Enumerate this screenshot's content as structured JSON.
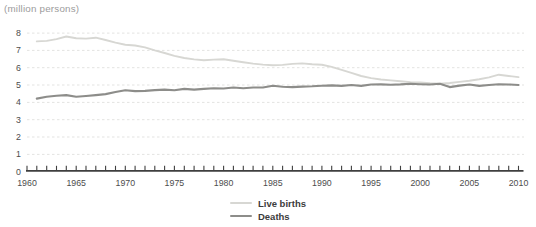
{
  "title": "(million persons)",
  "legend": [
    {
      "label": "Live births",
      "color": "#d7d7d3"
    },
    {
      "label": "Deaths",
      "color": "#8d8d8a"
    }
  ],
  "chart_data": {
    "type": "line",
    "unit_label": "(million persons)",
    "grid": "horizontal-dashed",
    "grid_color": "#e3e3e1",
    "axis_color": "#3f3f3f",
    "legend_position": "bottom-center",
    "x_axis_range": [
      1960,
      2010
    ],
    "xtick_labels": [
      1960,
      1965,
      1970,
      1975,
      1980,
      1985,
      1990,
      1995,
      2000,
      2005,
      2010
    ],
    "yticks": [
      0,
      1,
      2,
      3,
      4,
      5,
      6,
      7,
      8
    ],
    "ylim": [
      0,
      8
    ],
    "years": [
      1961,
      1962,
      1963,
      1964,
      1965,
      1966,
      1967,
      1968,
      1969,
      1970,
      1971,
      1972,
      1973,
      1974,
      1975,
      1976,
      1977,
      1978,
      1979,
      1980,
      1981,
      1982,
      1983,
      1984,
      1985,
      1986,
      1987,
      1988,
      1989,
      1990,
      1991,
      1992,
      1993,
      1994,
      1995,
      1996,
      1997,
      1998,
      1999,
      2000,
      2001,
      2002,
      2003,
      2004,
      2005,
      2006,
      2007,
      2008,
      2009,
      2010
    ],
    "series": [
      {
        "name": "Live births",
        "color": "#d7d7d3",
        "width": 1.9,
        "values": [
          7.52,
          7.55,
          7.65,
          7.8,
          7.7,
          7.68,
          7.73,
          7.6,
          7.45,
          7.33,
          7.28,
          7.17,
          7.0,
          6.85,
          6.68,
          6.56,
          6.48,
          6.43,
          6.47,
          6.49,
          6.4,
          6.32,
          6.24,
          6.18,
          6.14,
          6.16,
          6.22,
          6.25,
          6.2,
          6.17,
          6.05,
          5.88,
          5.7,
          5.52,
          5.4,
          5.32,
          5.27,
          5.22,
          5.17,
          5.15,
          5.1,
          5.08,
          5.12,
          5.18,
          5.25,
          5.34,
          5.44,
          5.6,
          5.52,
          5.46
        ]
      },
      {
        "name": "Deaths",
        "color": "#8d8d8a",
        "width": 2.1,
        "values": [
          4.22,
          4.33,
          4.38,
          4.42,
          4.33,
          4.37,
          4.42,
          4.48,
          4.6,
          4.7,
          4.65,
          4.66,
          4.71,
          4.74,
          4.7,
          4.78,
          4.74,
          4.78,
          4.82,
          4.8,
          4.86,
          4.82,
          4.86,
          4.86,
          4.96,
          4.9,
          4.88,
          4.91,
          4.93,
          4.96,
          4.98,
          4.95,
          5.0,
          4.95,
          5.03,
          5.04,
          5.02,
          5.04,
          5.07,
          5.05,
          5.03,
          5.08,
          4.88,
          4.97,
          5.03,
          4.95,
          5.0,
          5.05,
          5.03,
          5.0
        ]
      }
    ]
  }
}
